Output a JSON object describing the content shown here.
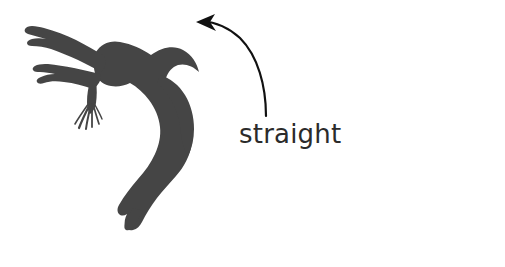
{
  "figure": {
    "kind": "silhouette-diagram",
    "background_color": "#ffffff",
    "width": 505,
    "height": 267,
    "silhouette": {
      "name": "gymnast-arched-body-silhouette",
      "description": "dark silhouette of a gymnast arched backwards in flight with ponytail, arms extended and legs pointed",
      "fill_color": "#454545"
    },
    "annotation": {
      "label": "straight",
      "text_color": "#2b2b2b",
      "arrow": {
        "name": "curved-arrow",
        "color": "#111111",
        "direction": "up-left",
        "start": [
          266,
          116
        ],
        "end": [
          198,
          23
        ]
      }
    }
  }
}
